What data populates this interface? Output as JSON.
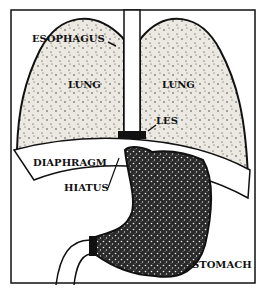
{
  "diagram": {
    "labels": {
      "esophagus": "ESOPHAGUS",
      "lung_left": "LUNG",
      "lung_right": "LUNG",
      "les": "LES",
      "diaphragm": "DIAPHRAGM",
      "hiatus": "HIATUS",
      "stomach": "STOMACH"
    },
    "colors": {
      "ink": "#111111",
      "lung_fill": "#e9e6df",
      "stomach_fill": "#3a3a3a",
      "background": "#ffffff"
    }
  }
}
